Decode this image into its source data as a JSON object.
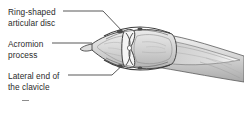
{
  "figure": {
    "background_color": "#ffffff",
    "text_color": "#2b2b2b",
    "leader_line_color": "#3a3a3a",
    "bone_fill_color": "#d8d8d8",
    "bone_outline_color": "#4a4a4a",
    "capsule_color": "#3d3d3d",
    "shading_color": "#b4b4b4"
  },
  "labels": {
    "disc": {
      "name": "ring-shaped-articular-disc",
      "line1": "Ring-shaped",
      "line2": "articular disc"
    },
    "acromion": {
      "name": "acromion-process",
      "line1": "Acromion",
      "line2": "process"
    },
    "clavicle": {
      "name": "lateral-end-of-the-clavicle",
      "line1": "Lateral end of",
      "line2": "the clavicle"
    }
  }
}
